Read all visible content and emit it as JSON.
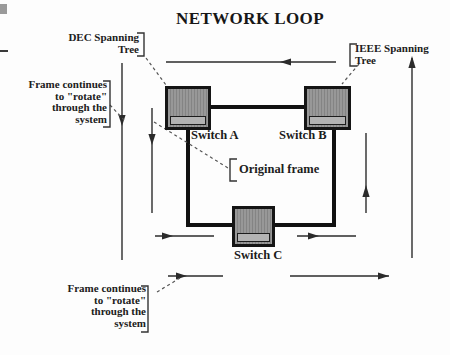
{
  "title": "NETWORK LOOP",
  "labels": {
    "dec": {
      "lines": [
        "DEC Spanning",
        "Tree"
      ]
    },
    "ieee": {
      "lines": [
        "IEEE Spanning",
        "Tree"
      ]
    },
    "frame_left": {
      "lines": [
        "Frame continues",
        "to \"rotate\"",
        "through the",
        "system"
      ]
    },
    "frame_bottom": {
      "lines": [
        "Frame continues",
        "to \"rotate\"",
        "through the",
        "system"
      ]
    },
    "original_frame": "Original frame"
  },
  "switches": {
    "a": "Switch A",
    "b": "Switch B",
    "c": "Switch C"
  },
  "colors": {
    "bus_line": "#111111",
    "arrow_line": "#2b2b2b",
    "leader_dashed": "#555555",
    "switch_body": "#989898",
    "switch_strip": "#b3b3b3",
    "text": "#1a1a1a",
    "background": "#fdfdfd"
  }
}
